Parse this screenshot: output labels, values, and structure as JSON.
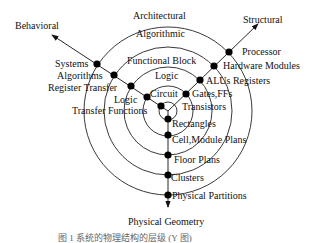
{
  "diagram": {
    "type": "Y-chart",
    "axes": {
      "behavioral": "Behavioral",
      "structural": "Structural",
      "physical": "Physical Geometry"
    },
    "levels": {
      "architectural": "Architectural",
      "algorithmic": "Algorithmic",
      "functional_block": "Functional Block",
      "logic": "Logic",
      "circuit": "Circuit"
    },
    "behavioral_items": [
      "Systems",
      "Algorithms",
      "Register Transfer",
      "Logic",
      "Transfer Functions"
    ],
    "structural_items": [
      "Processor",
      "Hardware Modules",
      "ALUs Registers",
      "Gates,FFs",
      "Transistors"
    ],
    "physical_items": [
      "Rectangles",
      "Cell,Module Plans",
      "Floor Plans",
      "Clusters",
      "Physical Partitions"
    ],
    "caption": "图 1    系统的物理结构的层级 (Y 图)"
  }
}
